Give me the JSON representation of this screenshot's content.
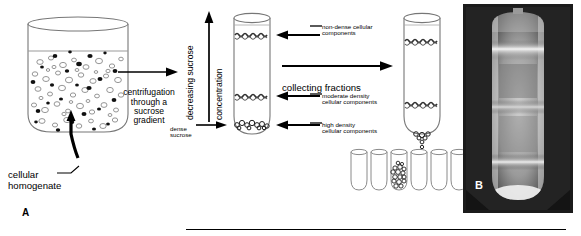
{
  "figure": {
    "panel_a_letter": "A",
    "panel_b_letter": "B",
    "width": 581,
    "height": 236
  },
  "labels": {
    "cellular_homogenate": "cellular\nhomogenate",
    "centrifugation": "centrifugation\nthrough a\nsucrose\ngradient",
    "decreasing_sucrose": "decreasing\nsucrose",
    "concentration": "concentration",
    "dense_sucrose": "dense\nsucrose",
    "collecting_fractions": "collecting fractions",
    "non_dense": "non-dense cellular\ncomponents",
    "moderate_density": "moderate density\ncellular components",
    "high_density": "high density\ncellular components"
  },
  "colors": {
    "ink": "#000000",
    "outline": "#6b6b6b",
    "band": "#3a3a3a",
    "photo_dark": "#1b1b1b",
    "photo_band": "#f2f2f2",
    "background": "#ffffff"
  },
  "diagram": {
    "beaker": {
      "name": "cellular-homogenate-beaker",
      "fill_level_text": "",
      "particle_counts": {
        "open_circles": 84,
        "filled_dots": 33
      }
    },
    "gradient_tube": {
      "name": "sucrose-gradient-tube",
      "bands": [
        {
          "id": "non-dense-band",
          "position_pct": 18,
          "style": "squiggle"
        },
        {
          "id": "moderate-band",
          "position_pct": 67,
          "style": "squiggle"
        },
        {
          "id": "high-density-band",
          "position_pct": 92,
          "style": "beads"
        }
      ]
    },
    "collecting_tube": {
      "name": "collecting-fractions-tube",
      "bands": [
        {
          "id": "non-dense-band",
          "position_pct": 22,
          "style": "squiggle"
        },
        {
          "id": "moderate-band",
          "position_pct": 70,
          "style": "squiggle"
        }
      ],
      "drip": true
    },
    "fraction_tubes": {
      "name": "fraction-tube-rack",
      "count": 6,
      "filled_index": 2
    },
    "arrows": [
      {
        "id": "centrifugation-arrow",
        "direction": "right"
      },
      {
        "id": "collecting-arrow",
        "direction": "right"
      },
      {
        "id": "concentration-arrow",
        "direction": "up"
      },
      {
        "id": "dense-sucrose-arrow",
        "direction": "right"
      },
      {
        "id": "homogenate-pointer-arrow",
        "direction": "up"
      },
      {
        "id": "non-dense-callout-arrow",
        "direction": "left"
      },
      {
        "id": "moderate-callout-arrow",
        "direction": "left"
      },
      {
        "id": "high-density-callout-arrow",
        "direction": "left"
      }
    ]
  },
  "photograph": {
    "name": "centrifuge-tube-photograph",
    "description": "dark photograph of a centrifuge tube showing bright bands"
  }
}
